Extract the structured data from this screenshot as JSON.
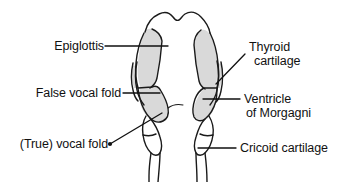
{
  "figure": {
    "background_color": "#ffffff",
    "outline_color": "#1a1a1a",
    "fill_color": "#d9d9d9",
    "leader_color": "#111111",
    "labels": {
      "epiglottis": "Epiglottis",
      "false_vocal_fold": "False vocal fold",
      "true_vocal_fold": "(True) vocal fold",
      "thyroid_cartilage_line1": "Thyroid",
      "thyroid_cartilage_line2": "cartilage",
      "ventricle_line1": "Ventricle",
      "ventricle_line2": "of Morgagni",
      "cricoid_cartilage": "Cricoid cartilage"
    }
  }
}
